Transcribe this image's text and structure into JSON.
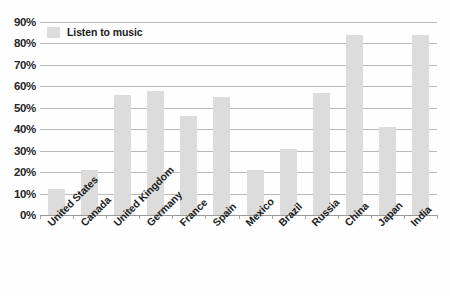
{
  "chart_data": {
    "type": "bar",
    "title": "",
    "subtitle": "",
    "xlabel": "",
    "ylabel": "",
    "categories": [
      "United States",
      "Canada",
      "United Kingdom",
      "Germany",
      "France",
      "Spain",
      "Mexico",
      "Brazil",
      "Russia",
      "China",
      "Japan",
      "India"
    ],
    "series": [
      {
        "name": "Listen to music",
        "color": "#dcdcdc",
        "values": [
          12,
          21,
          56,
          58,
          46,
          55,
          21,
          31,
          57,
          84,
          41,
          84
        ]
      }
    ],
    "values": [
      12,
      21,
      56,
      58,
      46,
      55,
      21,
      31,
      57,
      84,
      41,
      84
    ],
    "ylim": [
      0,
      90
    ],
    "ytick_labels": [
      "0%",
      "10%",
      "20%",
      "30%",
      "40%",
      "50%",
      "60%",
      "70%",
      "80%",
      "90%"
    ],
    "ytick_values": [
      0,
      10,
      20,
      30,
      40,
      50,
      60,
      70,
      80,
      90
    ],
    "grid": true,
    "legend": {
      "position": "top-left",
      "entries": [
        {
          "label": "Listen to music",
          "color": "#dcdcdc"
        }
      ]
    },
    "annotations": []
  },
  "style": {
    "background": "#fefefe",
    "bar_color": "#dcdcdc",
    "gridline_color": "#b9b9b9",
    "axis_color": "#9a9a9a",
    "text_color": "#222222"
  }
}
